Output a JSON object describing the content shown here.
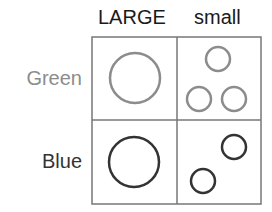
{
  "columns": [
    {
      "label": "LARGE"
    },
    {
      "label": "small"
    }
  ],
  "rows": [
    {
      "label": "Green",
      "label_color": "#8c8c8c",
      "stroke": "#8c8c8c"
    },
    {
      "label": "Blue",
      "label_color": "#333333",
      "stroke": "#333333"
    }
  ],
  "grid": {
    "stroke": "#777777"
  },
  "cells": {
    "green_large": [
      {
        "cx": 135,
        "cy": 78,
        "r": 25
      }
    ],
    "green_small": [
      {
        "cx": 218,
        "cy": 59,
        "r": 12
      },
      {
        "cx": 199,
        "cy": 99,
        "r": 12
      },
      {
        "cx": 234,
        "cy": 99,
        "r": 12
      }
    ],
    "blue_large": [
      {
        "cx": 134,
        "cy": 162,
        "r": 25
      }
    ],
    "blue_small": [
      {
        "cx": 234,
        "cy": 147,
        "r": 12
      },
      {
        "cx": 203,
        "cy": 181,
        "r": 12
      }
    ]
  }
}
